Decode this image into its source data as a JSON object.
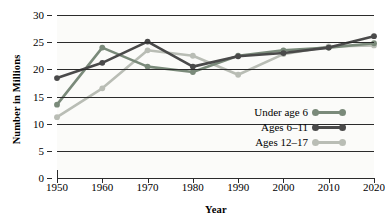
{
  "chart_data": {
    "type": "line",
    "title": "",
    "subtitle": "",
    "xlabel": "Year",
    "ylabel": "Number in Millions",
    "x": [
      1950,
      1960,
      1970,
      1980,
      1990,
      2000,
      2010,
      2020
    ],
    "xticklabels": [
      "1950",
      "1960",
      "1970",
      "1980",
      "1990",
      "2000",
      "2010",
      "2020"
    ],
    "yticklabels": [
      "0",
      "5",
      "10",
      "15",
      "20",
      "25",
      "30"
    ],
    "yticks": [
      0,
      5,
      10,
      15,
      20,
      25,
      30
    ],
    "xlim": [
      1950,
      2020
    ],
    "ylim": [
      0,
      30
    ],
    "grid": "horizontal",
    "legend_position": "inside-lower-right",
    "markers": "circle",
    "series": [
      {
        "name": "Under age 6",
        "color": "#7a8a7a",
        "values": [
          13.5,
          24.0,
          20.5,
          19.5,
          22.5,
          23.5,
          24.0,
          24.8
        ]
      },
      {
        "name": "Ages 6–11",
        "color": "#4a4a4a",
        "values": [
          18.4,
          21.2,
          25.1,
          20.5,
          22.4,
          23.0,
          24.0,
          26.1
        ]
      },
      {
        "name": "Ages 12–17",
        "color": "#b9bdb5",
        "values": [
          11.2,
          16.5,
          23.5,
          22.5,
          19.0,
          22.8,
          24.2,
          24.4
        ]
      }
    ]
  },
  "legend": {
    "entries": [
      {
        "label": "Under age 6"
      },
      {
        "label": "Ages 6–11"
      },
      {
        "label": "Ages 12–17"
      }
    ]
  }
}
